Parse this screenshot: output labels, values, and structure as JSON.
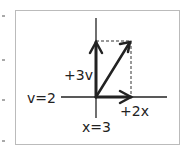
{
  "diagram": {
    "labels": {
      "v_axis": "v=2",
      "x_axis": "x=3",
      "up_vector": "+3v",
      "right_vector": "+2x"
    },
    "colors": {
      "stroke": "#222222",
      "frame": "#bbbbbb"
    }
  }
}
